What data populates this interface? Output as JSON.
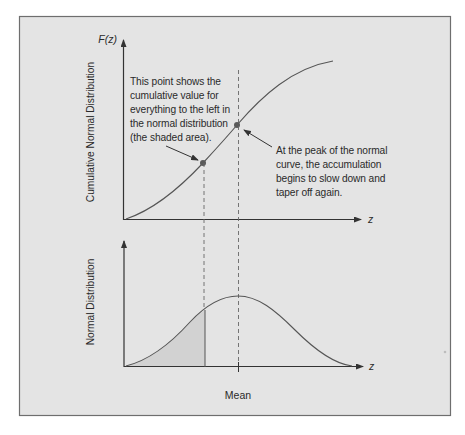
{
  "colors": {
    "page_background": "#ffffff",
    "panel_background": "#e4e4e4",
    "panel_border": "#6e6e6e",
    "line": "#4a4a4a",
    "shaded_area": "#d2d2d2",
    "point": "#5a5a5a",
    "text": "#2a2a2a"
  },
  "top_chart": {
    "y_axis_symbol": "F(z)",
    "y_axis_label": "Cumulative Normal Distribution",
    "x_axis_symbol": "z",
    "annotation_left": {
      "lines": [
        "This point shows the",
        "cumulative value for",
        "everything to the left in",
        "the normal distribution",
        "(the shaded area)."
      ]
    },
    "annotation_right": {
      "lines": [
        "At the peak of the normal",
        "curve, the accumulation",
        "begins to slow down and",
        "taper off again."
      ]
    }
  },
  "bottom_chart": {
    "y_axis_label": "Normal Distribution",
    "x_axis_symbol": "z",
    "x_axis_marker_label": "Mean"
  }
}
